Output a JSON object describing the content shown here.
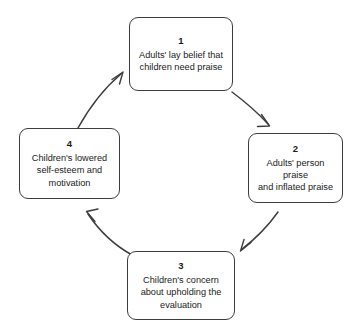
{
  "diagram": {
    "type": "cyclical-flow-diagram",
    "direction": "clockwise",
    "background_color": "#ffffff",
    "stroke_color": "#3d3d3d",
    "text_color": "#1a1a1a",
    "nodes": [
      {
        "number": "1",
        "text": "Adults' lay belief that\nchildren need praise"
      },
      {
        "number": "2",
        "text": "Adults' person praise\nand inflated praise"
      },
      {
        "number": "3",
        "text": "Children's concern\nabout upholding the\nevaluation"
      },
      {
        "number": "4",
        "text": "Children's lowered\nself-esteem and\nmotivation"
      }
    ],
    "arrows": [
      {
        "from": "1",
        "to": "2",
        "style": "curved-open-arrowhead"
      },
      {
        "from": "2",
        "to": "3",
        "style": "curved-open-arrowhead"
      },
      {
        "from": "3",
        "to": "4",
        "style": "curved-open-arrowhead"
      },
      {
        "from": "4",
        "to": "1",
        "style": "curved-open-arrowhead"
      }
    ]
  }
}
